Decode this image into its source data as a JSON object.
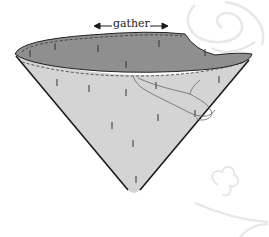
{
  "diagram": {
    "type": "cone-illustration",
    "label": "gather",
    "colors": {
      "cone_body": "#d4d4d4",
      "cone_interior": "#8f8f8f",
      "outline": "#1a1a1a",
      "stitch": "#444444",
      "watermark": "#e6e6e6",
      "background": "#ffffff"
    }
  }
}
